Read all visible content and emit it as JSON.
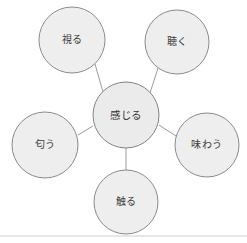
{
  "diagram": {
    "type": "radial-concept-map",
    "title": "",
    "canvas": {
      "width": 247,
      "height": 243,
      "background": "#ffffff"
    },
    "style": {
      "node_fill": "#eeeeee",
      "node_stroke": "#8a8a8a",
      "connector_stroke": "#9a9a9a",
      "label_color": "#3a3a3a",
      "page_edge_stroke": "#cfcfcf"
    },
    "center_node": {
      "id": "center",
      "label": "感じる",
      "cx": 126,
      "cy": 115,
      "r": 33
    },
    "nodes": [
      {
        "id": "see",
        "label": "視る",
        "cx": 72,
        "cy": 40,
        "r": 33
      },
      {
        "id": "hear",
        "label": "聴く",
        "cx": 177,
        "cy": 42,
        "r": 32
      },
      {
        "id": "smell",
        "label": "匂う",
        "cx": 45,
        "cy": 145,
        "r": 33
      },
      {
        "id": "taste",
        "label": "味わう",
        "cx": 207,
        "cy": 145,
        "r": 32
      },
      {
        "id": "touch",
        "label": "触る",
        "cx": 126,
        "cy": 202,
        "r": 32
      }
    ],
    "edges": [
      {
        "id": "center-see",
        "from": "center",
        "to": "see",
        "x1": 103,
        "y1": 92,
        "x2": 95,
        "y2": 64
      },
      {
        "id": "center-hear",
        "from": "center",
        "to": "hear",
        "x1": 150,
        "y1": 93,
        "x2": 158,
        "y2": 68
      },
      {
        "id": "center-smell",
        "from": "center",
        "to": "smell",
        "x1": 93,
        "y1": 126,
        "x2": 78,
        "y2": 135
      },
      {
        "id": "center-taste",
        "from": "center",
        "to": "taste",
        "x1": 159,
        "y1": 125,
        "x2": 176,
        "y2": 136
      },
      {
        "id": "center-touch",
        "from": "center",
        "to": "touch",
        "x1": 126,
        "y1": 148,
        "x2": 126,
        "y2": 170
      }
    ],
    "page_edge": {
      "x1": 0,
      "y1": 236,
      "x2": 247,
      "y2": 236
    }
  }
}
